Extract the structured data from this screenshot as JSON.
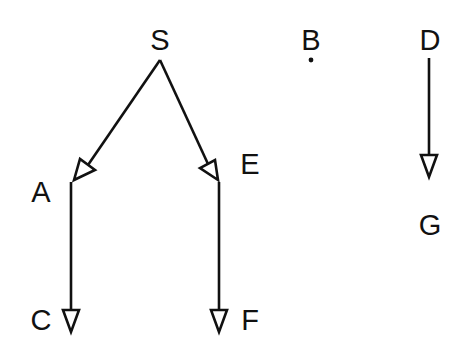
{
  "diagram": {
    "type": "directed-graph",
    "nodes": [
      {
        "id": "S",
        "label": "S",
        "x": 160,
        "y": 50
      },
      {
        "id": "A",
        "label": "A",
        "x": 41,
        "y": 202
      },
      {
        "id": "E",
        "label": "E",
        "x": 250,
        "y": 174
      },
      {
        "id": "C",
        "label": "C",
        "x": 41,
        "y": 330
      },
      {
        "id": "F",
        "label": "F",
        "x": 250,
        "y": 330
      },
      {
        "id": "B",
        "label": "B",
        "x": 311,
        "y": 50
      },
      {
        "id": "D",
        "label": "D",
        "x": 430,
        "y": 50
      },
      {
        "id": "G",
        "label": "G",
        "x": 430,
        "y": 235
      }
    ],
    "edges": [
      {
        "from": "S",
        "to": "A"
      },
      {
        "from": "S",
        "to": "E"
      },
      {
        "from": "A",
        "to": "C"
      },
      {
        "from": "E",
        "to": "F"
      },
      {
        "from": "D",
        "to": "G"
      }
    ],
    "isolated_points": [
      {
        "near": "B",
        "x": 311,
        "y": 60
      }
    ],
    "colors": {
      "ink": "#111111",
      "background": "#ffffff"
    }
  },
  "labels": {
    "S": "S",
    "A": "A",
    "E": "E",
    "C": "C",
    "F": "F",
    "B": "B",
    "D": "D",
    "G": "G"
  }
}
